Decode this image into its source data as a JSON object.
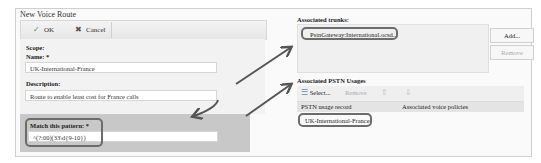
{
  "window": {
    "title": "New Voice Route"
  },
  "toolbar": {
    "ok_label": "OK",
    "cancel_label": "Cancel"
  },
  "form": {
    "scope_label": "Scope:",
    "name_label": "Name: *",
    "name_value": "UK-International-France",
    "description_label": "Description:",
    "description_value": "Route to enable least cost for France calls",
    "pattern_label": "Match this pattern: *",
    "pattern_value": "^(?:00)(33\\d{9-10})"
  },
  "trunks": {
    "title": "Associated trunks:",
    "items": [
      "PstnGateway:International.ocsd..."
    ],
    "add_label": "Add...",
    "remove_label": "Remove"
  },
  "pstn": {
    "title": "Associated PSTN Usages",
    "select_label": "Select...",
    "remove_label": "Remove",
    "columns": [
      "PSTN usage record",
      "Associated voice policies"
    ],
    "rows": [
      {
        "record": "UK-International-France",
        "policies": ""
      }
    ]
  },
  "colors": {
    "highlight_border": "#6c6c6c",
    "arrow": "#555555",
    "pattern_bg": "#c8c8c8"
  }
}
